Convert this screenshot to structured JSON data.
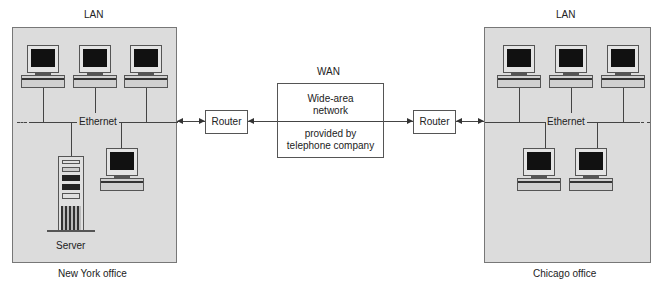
{
  "diagram": {
    "left_site": {
      "top_label": "LAN",
      "bottom_label": "New York office",
      "bus_label": "Ethernet",
      "devices": [
        "workstation",
        "workstation",
        "workstation",
        "workstation",
        "server"
      ],
      "server_label": "Server"
    },
    "right_site": {
      "top_label": "LAN",
      "bottom_label": "Chicago office",
      "bus_label": "Ethernet",
      "devices": [
        "workstation",
        "workstation",
        "workstation",
        "workstation",
        "workstation"
      ]
    },
    "left_router": {
      "label": "Router"
    },
    "right_router": {
      "label": "Router"
    },
    "wan": {
      "title": "WAN",
      "line1": "Wide-area",
      "line2": "network",
      "line3": "provided by",
      "line4": "telephone company"
    },
    "colors": {
      "lan_fill": "#dcdcdc",
      "box_border": "#555555",
      "screen": "#111111"
    }
  }
}
